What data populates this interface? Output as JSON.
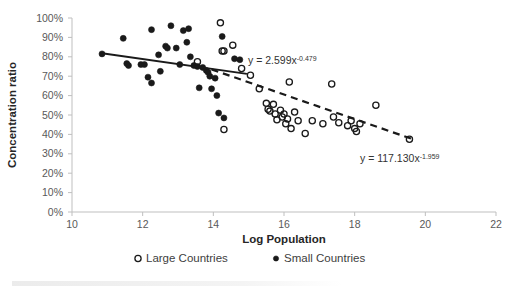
{
  "chart_data": {
    "type": "scatter",
    "title": "",
    "xlabel": "Log Population",
    "ylabel": "Concentration ratio",
    "xlim": [
      10,
      22
    ],
    "ylim": [
      0,
      1
    ],
    "xticks": [
      "10",
      "12",
      "14",
      "16",
      "18",
      "20",
      "22"
    ],
    "xtick_values": [
      10,
      12,
      14,
      16,
      18,
      20,
      22
    ],
    "yticks": [
      "0%",
      "10%",
      "20%",
      "30%",
      "40%",
      "50%",
      "60%",
      "70%",
      "80%",
      "90%",
      "100%"
    ],
    "ytick_values": [
      0,
      0.1,
      0.2,
      0.3,
      0.4,
      0.5,
      0.6,
      0.7,
      0.8,
      0.9,
      1.0
    ],
    "grid": false,
    "legend_position": "bottom",
    "series": [
      {
        "name": "Small Countries",
        "marker": "filled-circle",
        "color": "#1a1a1a",
        "points": [
          [
            10.85,
            0.815
          ],
          [
            11.45,
            0.895
          ],
          [
            11.55,
            0.765
          ],
          [
            11.6,
            0.755
          ],
          [
            11.95,
            0.76
          ],
          [
            12.05,
            0.76
          ],
          [
            12.15,
            0.695
          ],
          [
            12.25,
            0.94
          ],
          [
            12.25,
            0.665
          ],
          [
            12.45,
            0.81
          ],
          [
            12.5,
            0.725
          ],
          [
            12.65,
            0.855
          ],
          [
            12.7,
            0.845
          ],
          [
            12.8,
            0.96
          ],
          [
            12.95,
            0.845
          ],
          [
            13.05,
            0.76
          ],
          [
            13.15,
            0.935
          ],
          [
            13.25,
            0.875
          ],
          [
            13.3,
            0.945
          ],
          [
            13.35,
            0.8
          ],
          [
            13.45,
            0.755
          ],
          [
            13.55,
            0.75
          ],
          [
            13.6,
            0.64
          ],
          [
            13.7,
            0.745
          ],
          [
            13.8,
            0.73
          ],
          [
            13.85,
            0.72
          ],
          [
            13.9,
            0.7
          ],
          [
            13.95,
            0.635
          ],
          [
            14.05,
            0.69
          ],
          [
            14.1,
            0.6
          ],
          [
            14.15,
            0.51
          ],
          [
            14.25,
            0.905
          ],
          [
            14.3,
            0.485
          ],
          [
            14.6,
            0.79
          ],
          [
            14.75,
            0.785
          ]
        ]
      },
      {
        "name": "Large Countries",
        "marker": "open-circle",
        "color": "#1a1a1a",
        "points": [
          [
            13.55,
            0.775
          ],
          [
            14.2,
            0.975
          ],
          [
            14.25,
            0.83
          ],
          [
            14.3,
            0.83
          ],
          [
            14.55,
            0.86
          ],
          [
            14.3,
            0.425
          ],
          [
            14.8,
            0.74
          ],
          [
            15.05,
            0.705
          ],
          [
            15.3,
            0.635
          ],
          [
            15.5,
            0.56
          ],
          [
            15.55,
            0.53
          ],
          [
            15.6,
            0.52
          ],
          [
            15.7,
            0.555
          ],
          [
            15.75,
            0.505
          ],
          [
            15.8,
            0.475
          ],
          [
            15.9,
            0.525
          ],
          [
            15.95,
            0.49
          ],
          [
            16.0,
            0.505
          ],
          [
            16.05,
            0.455
          ],
          [
            16.1,
            0.48
          ],
          [
            16.15,
            0.67
          ],
          [
            16.2,
            0.43
          ],
          [
            16.3,
            0.515
          ],
          [
            16.4,
            0.47
          ],
          [
            16.6,
            0.405
          ],
          [
            16.8,
            0.47
          ],
          [
            17.1,
            0.455
          ],
          [
            17.35,
            0.66
          ],
          [
            17.4,
            0.49
          ],
          [
            17.55,
            0.46
          ],
          [
            17.8,
            0.445
          ],
          [
            17.9,
            0.47
          ],
          [
            18.0,
            0.43
          ],
          [
            18.05,
            0.415
          ],
          [
            18.15,
            0.455
          ],
          [
            18.6,
            0.55
          ],
          [
            19.55,
            0.375
          ]
        ]
      }
    ],
    "trendlines": [
      {
        "name": "small-countries-trendline",
        "style": "solid",
        "equation_prefix": "y = 2.599x",
        "equation_exponent": "-0.479",
        "x_start": 10.85,
        "y_start": 0.818,
        "x_end": 14.95,
        "y_end": 0.712
      },
      {
        "name": "large-countries-trendline",
        "style": "dashed",
        "equation_prefix": "y = 117.130x",
        "equation_exponent": "-1.959",
        "x_start": 13.95,
        "y_start": 0.735,
        "x_end": 19.6,
        "y_end": 0.378
      }
    ],
    "annotations": [
      {
        "name": "equation-small",
        "prefix": "y = 2.599x",
        "exponent": "-0.479",
        "x_px": 248,
        "y_px": 64
      },
      {
        "name": "equation-large",
        "prefix": "y = 117.130x",
        "exponent": "-1.959",
        "x_px": 360,
        "y_px": 162
      }
    ],
    "legend": [
      {
        "label": "Large Countries",
        "marker": "open-circle"
      },
      {
        "label": "Small Countries",
        "marker": "filled-circle"
      }
    ]
  }
}
